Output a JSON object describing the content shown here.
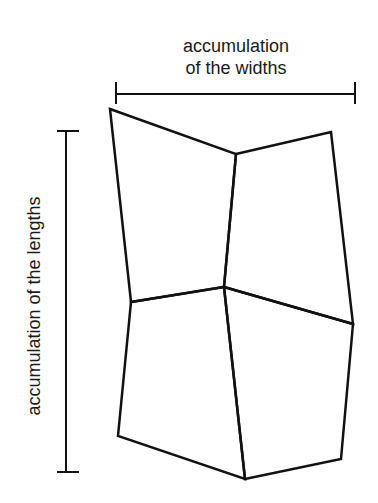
{
  "diagram": {
    "width_label": {
      "line1": "accumulation",
      "line2": "of the widths"
    },
    "length_label": "accumulation of the lengths",
    "colors": {
      "stroke": "#111111",
      "text": "#1a1a1a",
      "background": "#ffffff"
    },
    "width_bracket": {
      "x1": 116,
      "x2": 355,
      "y": 94,
      "tick_top": 82,
      "tick_bottom": 104
    },
    "length_bracket": {
      "x": 66,
      "y1": 131,
      "y2": 472,
      "tick_left": 57,
      "tick_right": 79
    },
    "vertices": {
      "top_left": [
        110,
        109
      ],
      "top_middle": [
        236,
        154
      ],
      "top_right": [
        331,
        132
      ],
      "middle_left": [
        131,
        302
      ],
      "center": [
        224,
        287
      ],
      "middle_right": [
        353,
        324
      ],
      "bottom_left": [
        118,
        436
      ],
      "bottom_middle": [
        245,
        479
      ],
      "bottom_right": [
        341,
        459
      ]
    },
    "cells": [
      {
        "name": "upper-left-cell",
        "points": "110,109 236,154 224,287 131,302"
      },
      {
        "name": "upper-right-cell",
        "points": "236,154 331,132 353,324 224,287"
      },
      {
        "name": "lower-left-cell",
        "points": "131,302 224,287 245,479 118,436"
      },
      {
        "name": "lower-right-cell",
        "points": "224,287 353,324 341,459 245,479"
      }
    ]
  }
}
